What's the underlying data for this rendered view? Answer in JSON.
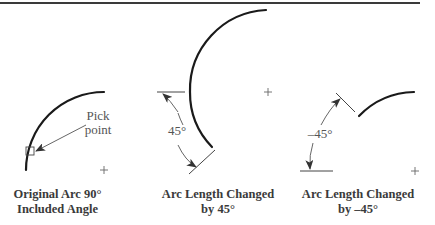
{
  "figure": {
    "top_rule_color": "#3a3a3a",
    "panels": [
      {
        "id": "original",
        "caption_line1": "Original Arc 90°",
        "caption_line2": "Included Angle",
        "callout_line1": "Pick",
        "callout_line2": "point"
      },
      {
        "id": "plus45",
        "caption_line1": "Arc Length Changed",
        "caption_line2": "by 45°",
        "angle_label": "45°"
      },
      {
        "id": "minus45",
        "caption_line1": "Arc Length Changed",
        "caption_line2": "by –45°",
        "angle_label": "–45°"
      }
    ]
  }
}
